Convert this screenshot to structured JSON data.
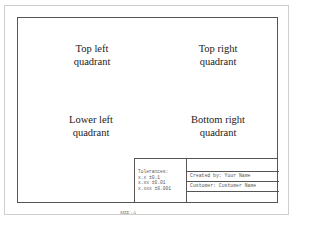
{
  "quadrants": {
    "top_left": [
      "Top left",
      "quadrant"
    ],
    "top_right": [
      "Top right",
      "quadrant"
    ],
    "lower_left": [
      "Lower left",
      "quadrant"
    ],
    "bottom_right": [
      "Bottom right",
      "quadrant"
    ]
  },
  "title_block": {
    "tolerances_label": "Tolerances:",
    "tolerances": [
      "x.x ±0.1",
      "x.xx ±0.01",
      "x.xxx ±0.001"
    ],
    "created_by": "Created by: Your Name",
    "customer": "Customer: Customer Name"
  },
  "size_label": "SIZE : A",
  "colors": {
    "border_outer": "#cfcfcf",
    "border_inner": "#555555",
    "text": "#222222"
  }
}
